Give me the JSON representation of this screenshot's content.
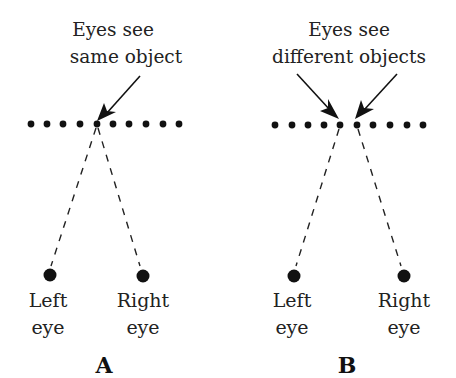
{
  "panels": [
    {
      "id": "A",
      "label": "A",
      "caption": [
        "Eyes see",
        "same object"
      ],
      "left_eye": [
        "Left",
        "eye"
      ],
      "right_eye": [
        "Right",
        "eye"
      ]
    },
    {
      "id": "B",
      "label": "B",
      "caption": [
        "Eyes see",
        "different objects"
      ],
      "left_eye": [
        "Left",
        "eye"
      ],
      "right_eye": [
        "Right",
        "eye"
      ]
    }
  ],
  "colors": {
    "ink": "#111111",
    "background": "#ffffff"
  }
}
